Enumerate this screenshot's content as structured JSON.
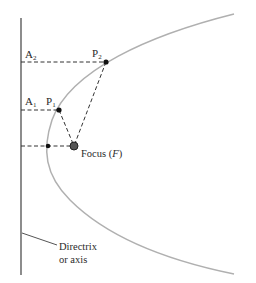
{
  "diagram": {
    "type": "parabola-focus-directrix",
    "labels": {
      "a2": "A",
      "a2_sub": "2",
      "p2": "P",
      "p2_sub": "2",
      "a1": "A",
      "a1_sub": "1",
      "p1": "P",
      "p1_sub": "1",
      "focus_prefix": "Focus (",
      "focus_var": "F",
      "focus_suffix": ")",
      "directrix_line1": "Directrix",
      "directrix_line2": "or axis"
    },
    "colors": {
      "curve": "#b0b0b0",
      "directrix": "#707070",
      "dashed": "#333333",
      "point": "#111111",
      "focus": "#333333"
    }
  }
}
